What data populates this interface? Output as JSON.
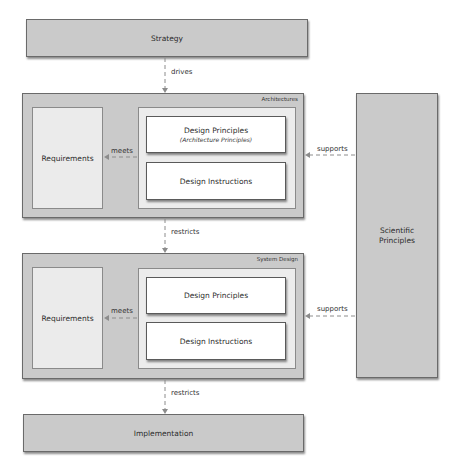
{
  "diagram": {
    "strategy": {
      "label": "Strategy"
    },
    "architectures": {
      "title": "Architectures",
      "requirements": "Requirements",
      "design_principles": "Design Principles",
      "design_principles_sub": "(Architecture Principles)",
      "design_instructions": "Design Instructions",
      "meets": "meets"
    },
    "system_design": {
      "title": "System Design",
      "requirements": "Requirements",
      "design_principles": "Design Principles",
      "design_instructions": "Design Instructions",
      "meets": "meets"
    },
    "implementation": {
      "label": "Implementation"
    },
    "scientific_principles": {
      "label": "Scientific Principles"
    },
    "edges": {
      "drives": "drives",
      "restricts_1": "restricts",
      "restricts_2": "restricts",
      "supports_1": "supports",
      "supports_2": "supports"
    },
    "colors": {
      "box_fill": "#cacaca",
      "inner_fill": "#ececec",
      "white_fill": "#ffffff",
      "arrow": "#8c8c8c"
    }
  }
}
